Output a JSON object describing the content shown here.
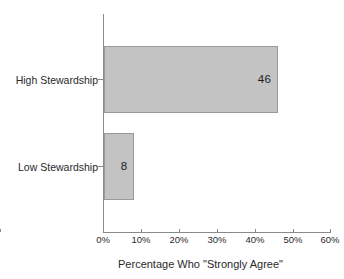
{
  "chart_data": {
    "type": "bar",
    "orientation": "horizontal",
    "title": "",
    "categories": [
      "High Stewardship",
      "Low Stewardship"
    ],
    "values": [
      46,
      8
    ],
    "data_labels": [
      "46",
      "8"
    ],
    "xlabel": "Percentage Who \"Strongly Agree\"",
    "ylabel": "",
    "xlim": [
      0,
      60
    ],
    "xticks": [
      0,
      10,
      20,
      30,
      40,
      50,
      60
    ],
    "xtick_labels": [
      "0%",
      "10%",
      "20%",
      "30%",
      "40%",
      "50%",
      "60%"
    ],
    "grid": false,
    "legend": null,
    "colors": {
      "bar_fill": "#c3c3c3",
      "bar_border": "#9a9a9a",
      "axis": "#8a8a8a",
      "text": "#2a2a2a",
      "background": "#ffffff"
    }
  }
}
